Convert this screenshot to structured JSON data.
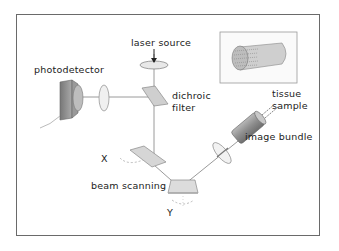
{
  "labels": {
    "laser_source": "laser source",
    "photodetector": "photodetector",
    "dichroic_filter_line1": "dichroic",
    "dichroic_filter_line2": "filter",
    "tissue_sample_line1": "tissue",
    "tissue_sample_line2": "sample",
    "image_bundle": "image bundle",
    "axis_x": "X",
    "axis_y": "Y",
    "beam_scanning": "beam scanning"
  },
  "components": [
    "laser source lens",
    "photodetector",
    "detector lens",
    "dichroic filter",
    "X scan mirror",
    "Y scan mirror",
    "objective lens",
    "image bundle",
    "fiber bundle cross-section inset"
  ],
  "colors": {
    "frame": "#6a6a6a",
    "beam": "#9a9a9a",
    "component_fill": "#d6d6d6",
    "component_dark": "#8a8a8a",
    "text": "#222222"
  }
}
